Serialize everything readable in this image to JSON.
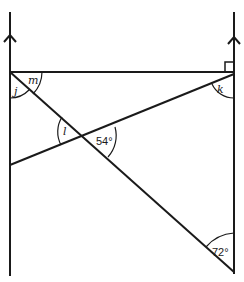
{
  "diagram": {
    "type": "geometry",
    "parallel_lines": [
      {
        "name": "left-parallel",
        "arrow": "up"
      },
      {
        "name": "right-parallel",
        "arrow": "up"
      }
    ],
    "right_angle": {
      "location": "top-right corner",
      "marker": "square"
    },
    "angles": {
      "m": "m",
      "j": "j",
      "k": "k",
      "l": "l",
      "given_54": "54°",
      "given_72": "72°"
    }
  }
}
